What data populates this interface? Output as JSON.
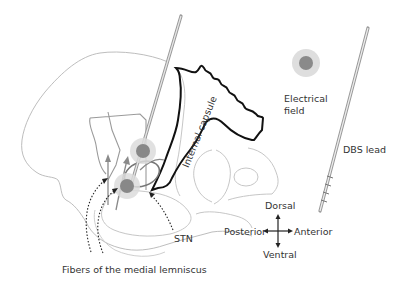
{
  "diagram": {
    "type": "anatomical-schematic",
    "labels": {
      "internal_capsule": "Internal capsule",
      "electrical_field_line1": "Electrical",
      "electrical_field_line2": "field",
      "dbs_lead": "DBS lead",
      "stn": "STN",
      "fibers": "Fibers of the medial lemniscus",
      "dorsal": "Dorsal",
      "ventral": "Ventral",
      "posterior": "Posterior",
      "anterior": "Anterior"
    },
    "colors": {
      "outline": "#b0b0b0",
      "capsule": "#111111",
      "lead": "#999999",
      "field_outer": "#dddddd",
      "field_inner": "#888888",
      "text": "#333333"
    }
  }
}
